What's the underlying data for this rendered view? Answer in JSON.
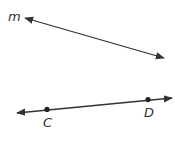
{
  "diagram": {
    "colors": {
      "stroke": "#333333",
      "background": "#ffffff"
    },
    "lines": [
      {
        "name": "line-m",
        "label": "m",
        "x1": 25,
        "y1": 18,
        "x2": 164,
        "y2": 58,
        "arrows": "both"
      },
      {
        "name": "line-cd",
        "label": "",
        "x1": 17,
        "y1": 113,
        "x2": 172,
        "y2": 98,
        "arrows": "both"
      }
    ],
    "points": [
      {
        "name": "C",
        "label": "C",
        "x": 47,
        "y": 109
      },
      {
        "name": "D",
        "label": "D",
        "x": 148,
        "y": 100
      }
    ],
    "labels": {
      "m": "m",
      "c": "C",
      "d": "D"
    }
  }
}
